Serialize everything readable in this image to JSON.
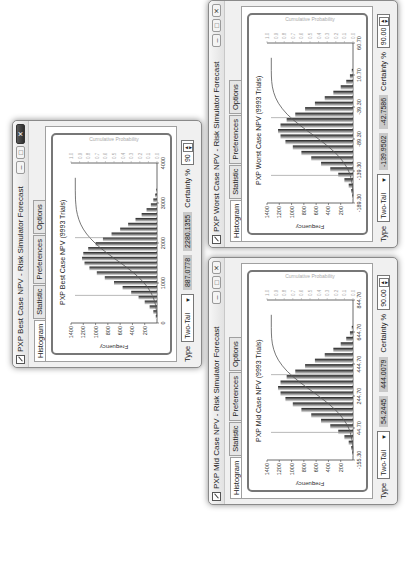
{
  "windows": [
    {
      "id": "best",
      "title": "PXP Best Case NPV - Risk Simulator Forecast",
      "active": true,
      "tabs": [
        "Histogram",
        "Statistic",
        "Preferences",
        "Options"
      ],
      "active_tab": "Histogram",
      "chart_title": "PXP Best Case NPV (9993 Trials)",
      "type_label": "Type",
      "type_value": "Two-Tail",
      "lower_value": "887.0778",
      "upper_value": "2280.1355",
      "certainty_label": "Certainty %",
      "certainty_value": "90"
    },
    {
      "id": "worst",
      "title": "PXP Worst Case NPV - Risk Simulator Forecast",
      "active": false,
      "tabs": [
        "Histogram",
        "Statistic",
        "Preferences",
        "Options"
      ],
      "active_tab": "Histogram",
      "chart_title": "PXP Worst Case NPV (9993 Trials)",
      "type_label": "Type",
      "type_value": "Two-Tail",
      "lower_value": "-139.9502",
      "upper_value": "-42.7586",
      "certainty_label": "Certainty %",
      "certainty_value": "90.00"
    },
    {
      "id": "mid",
      "title": "PXP Mid Case NPV - Risk Simulator Forecast",
      "active": false,
      "tabs": [
        "Histogram",
        "Statistic",
        "Preferences",
        "Options"
      ],
      "active_tab": "Histogram",
      "chart_title": "PXP Mid Case NPV (9993 Trials)",
      "type_label": "Type",
      "type_value": "Two-Tail",
      "lower_value": "54.2445",
      "upper_value": "444.0079",
      "certainty_label": "Certainty %",
      "certainty_value": "90.00"
    }
  ],
  "chart_data": [
    {
      "type": "bar",
      "title": "PXP Best Case NPV (9993 Trials)",
      "xlabel": "",
      "ylabel": "Frequency",
      "y2label": "Cumulative Probability",
      "x_ticks": [
        "0",
        "1000",
        "2000",
        "3000",
        "4000"
      ],
      "y_ticks": [
        200,
        400,
        600,
        800,
        1000,
        1200,
        1400
      ],
      "y2_ticks": [
        0.0,
        0.1,
        0.2,
        0.3,
        0.4,
        0.5,
        0.6,
        0.7,
        0.8,
        0.9,
        1.0
      ],
      "ylim": [
        0,
        1400
      ],
      "values": [
        20,
        60,
        120,
        200,
        300,
        420,
        560,
        700,
        850,
        980,
        1100,
        1180,
        1220,
        1200,
        1120,
        1000,
        880,
        740,
        600,
        470,
        350,
        250,
        170,
        100,
        60,
        30,
        12
      ],
      "certainty_bounds": [
        887.0778,
        2280.1355
      ]
    },
    {
      "type": "bar",
      "title": "PXP Worst Case NPV (9993 Trials)",
      "xlabel": "",
      "ylabel": "Frequency",
      "y2label": "Cumulative Probability",
      "x_ticks": [
        "-189.30",
        "-139.30",
        "-89.30",
        "-39.30",
        "10.70",
        "60.70"
      ],
      "y_ticks": [
        200,
        400,
        600,
        800,
        1000,
        1200,
        1400
      ],
      "y2_ticks": [
        0.0,
        0.1,
        0.2,
        0.3,
        0.4,
        0.5,
        0.6,
        0.7,
        0.8,
        0.9,
        1.0
      ],
      "ylim": [
        0,
        1400
      ],
      "values": [
        10,
        30,
        70,
        140,
        240,
        370,
        520,
        680,
        840,
        980,
        1100,
        1180,
        1220,
        1180,
        1080,
        940,
        780,
        620,
        460,
        320,
        200,
        110,
        50,
        20
      ],
      "certainty_bounds": [
        -139.9502,
        -42.7586
      ]
    },
    {
      "type": "bar",
      "title": "PXP Mid Case NPV (9993 Trials)",
      "xlabel": "",
      "ylabel": "Frequency",
      "y2label": "Cumulative Probability",
      "x_ticks": [
        "-155.30",
        "44.70",
        "244.70",
        "444.70",
        "644.70",
        "844.70"
      ],
      "y_ticks": [
        200,
        400,
        600,
        800,
        1000,
        1200,
        1400
      ],
      "y2_ticks": [
        0.0,
        0.1,
        0.2,
        0.3,
        0.4,
        0.5,
        0.6,
        0.7,
        0.8,
        0.9,
        1.0
      ],
      "ylim": [
        0,
        1400
      ],
      "values": [
        10,
        30,
        70,
        140,
        240,
        370,
        520,
        680,
        840,
        980,
        1100,
        1180,
        1220,
        1180,
        1080,
        940,
        780,
        620,
        460,
        320,
        200,
        110,
        50,
        20
      ],
      "certainty_bounds": [
        54.2445,
        444.0079
      ]
    }
  ]
}
